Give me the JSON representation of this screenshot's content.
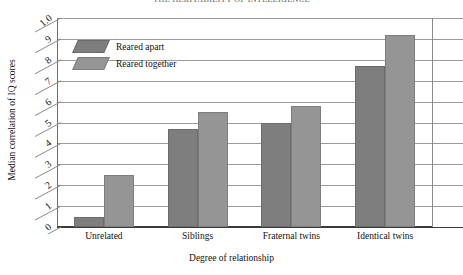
{
  "chart_data": {
    "type": "bar",
    "title": "THE HERITABILITY OF INTELLIGENCE",
    "xlabel": "Degree of relationship",
    "ylabel": "Median correlation of IQ scores",
    "categories": [
      "Unrelated",
      "Siblings",
      "Fraternal twins",
      "Identical twins"
    ],
    "series": [
      {
        "name": "Reared apart",
        "values": [
          0.05,
          0.47,
          0.5,
          0.77
        ]
      },
      {
        "name": "Reared together",
        "values": [
          0.25,
          0.55,
          0.58,
          0.92
        ]
      }
    ],
    "ylim": [
      0,
      1.0
    ],
    "yticks": [
      "0",
      "1",
      "2",
      "3",
      "4",
      "5",
      "6",
      "7",
      "8",
      "9",
      "1.0"
    ],
    "ytick_values": [
      0,
      0.1,
      0.2,
      0.3,
      0.4,
      0.5,
      0.6,
      0.7,
      0.8,
      0.9,
      1.0
    ],
    "grid": true,
    "legend_position": "top-left",
    "colors": {
      "reared_apart": "#7e7e7e",
      "reared_together": "#959595",
      "gridline": "#9a9a9a",
      "axis": "#3a3a3a",
      "background": "#ffffff"
    }
  }
}
